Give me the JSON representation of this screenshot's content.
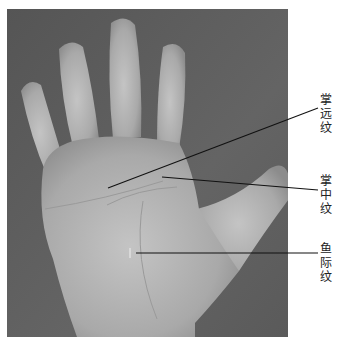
{
  "figure": {
    "background_color": "#ffffff",
    "photo_bg_color": "#5e5e5e",
    "skin_color": "#b8b8b8",
    "line_color": "#111111"
  },
  "annotations": [
    {
      "id": "proximal-palmar-crease",
      "label": "掌远纹",
      "chars": [
        "掌",
        "远",
        "纹"
      ],
      "point": [
        108,
        188
      ],
      "label_pos": [
        318,
        108
      ]
    },
    {
      "id": "middle-palmar-crease",
      "label": "掌中纹",
      "chars": [
        "掌",
        "中",
        "纹"
      ],
      "point": [
        162,
        177
      ],
      "label_pos": [
        318,
        190
      ]
    },
    {
      "id": "thenar-crease",
      "label": "鱼际纹",
      "chars": [
        "鱼",
        "际",
        "纹"
      ],
      "point": [
        136,
        253
      ],
      "label_pos": [
        318,
        253
      ]
    }
  ]
}
